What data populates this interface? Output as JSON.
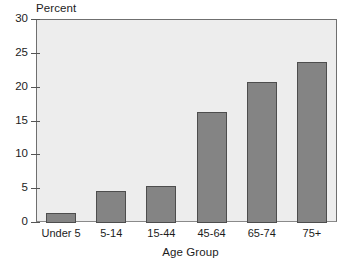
{
  "chart_data": {
    "type": "bar",
    "title": "",
    "subtitle": "",
    "xlabel": "Age Group",
    "ylabel": "Percent",
    "categories": [
      "Under 5",
      "5-14",
      "15-44",
      "45-64",
      "65-74",
      "75+"
    ],
    "values": [
      1.5,
      4.8,
      5.4,
      16.4,
      20.9,
      23.8
    ],
    "ylim": [
      0,
      30
    ],
    "yticks": [
      0,
      5,
      10,
      15,
      20,
      25,
      30
    ],
    "ytick_labels": [
      "0",
      "5",
      "10",
      "15",
      "20",
      "25",
      "30"
    ],
    "grid": false,
    "legend": "none",
    "bar_color": "#848484",
    "bar_edge_color": "#4d4d4d",
    "plot_background": "#ededed",
    "axis_color": "#6f6f6f",
    "text_color": "#1c1c1c"
  }
}
